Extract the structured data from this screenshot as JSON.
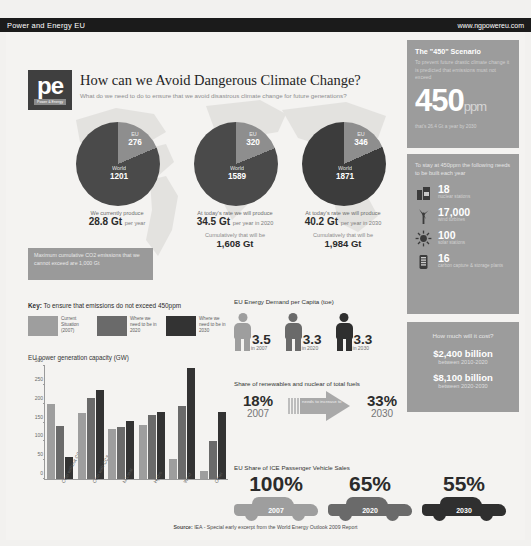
{
  "topbar": {
    "brand": "Power and Energy EU",
    "site": "www.ngpowereu.com"
  },
  "logo": {
    "mark": "pe",
    "sub": "Power & Energy"
  },
  "header": {
    "title": "How can we Avoid Dangerous Climate Change?",
    "subtitle": "What do we need to do to ensure that we avoid disastrous climate change for future generations?"
  },
  "chart_data": [
    {
      "type": "pie",
      "title": "Current emissions",
      "labels": [
        "EU",
        "World"
      ],
      "values": [
        276,
        1201
      ],
      "caption_before": "We currently produce",
      "caption_value": "28.8 Gt",
      "caption_after": "per year"
    },
    {
      "type": "pie",
      "title": "2020 emissions",
      "labels": [
        "EU",
        "World"
      ],
      "values": [
        320,
        1589
      ],
      "caption_before": "At today's rate we will produce",
      "caption_value": "34.5 Gt",
      "caption_after": "per year in 2020",
      "cumulative_label": "Cumulatively that will be",
      "cumulative_value": "1,608 Gt"
    },
    {
      "type": "pie",
      "title": "2030 emissions",
      "labels": [
        "EU",
        "World"
      ],
      "values": [
        346,
        1871
      ],
      "caption_before": "At today's rate we will produce",
      "caption_value": "40.2 Gt",
      "caption_after": "per year in 2030",
      "cumulative_label": "Cumulatively that will be",
      "cumulative_value": "1,984 Gt"
    },
    {
      "type": "bar",
      "title": "EU power generation capacity (GW)",
      "categories": [
        "Coal without CCS",
        "Coal with CCS",
        "Nuclear",
        "Hydro",
        "Wind",
        "Other"
      ],
      "series": [
        {
          "name": "Current Situation (2007)",
          "color": "#9e9e9e",
          "values": [
            200,
            175,
            133,
            144,
            52,
            22
          ]
        },
        {
          "name": "Where we need to be in 2020",
          "color": "#6a6a6a",
          "values": [
            140,
            214,
            138,
            170,
            195,
            102
          ]
        },
        {
          "name": "Where we need to be in 2030",
          "color": "#333333",
          "values": [
            58,
            235,
            153,
            178,
            296,
            178
          ]
        }
      ],
      "ylim": [
        0,
        300
      ],
      "yticks": [
        0,
        50,
        100,
        150,
        200,
        250,
        300
      ],
      "ylabel": "",
      "xlabel": "",
      "grid": false,
      "legend": "key"
    },
    {
      "type": "bar",
      "title": "EU Energy Demand per Capita (toe)",
      "categories": [
        "in 2007",
        "in 2020",
        "in 2030"
      ],
      "values": [
        3.5,
        3.3,
        3.3
      ],
      "ylabel": "toe per capita"
    },
    {
      "type": "bar",
      "title": "Share of renewables and nuclear of total fuels",
      "categories": [
        "2007",
        "2030"
      ],
      "values": [
        18,
        33
      ],
      "ylabel": "%",
      "annotation": "needs to increase to"
    },
    {
      "type": "bar",
      "title": "EU Share of ICE Passenger Vehicle Sales",
      "categories": [
        "2007",
        "2020",
        "2030"
      ],
      "values": [
        100,
        65,
        55
      ],
      "ylabel": "%"
    }
  ],
  "note_box": "Maximum cumulative CO2 emissions that we cannot exceed are 1,000 Gt",
  "key": {
    "label": "Key:",
    "text": "To ensure that emissions do not exceed 450ppm",
    "items": [
      {
        "label": "Current Situation (2007)",
        "color": "#9e9e9e"
      },
      {
        "label": "Where we need to be in 2020",
        "color": "#6a6a6a"
      },
      {
        "label": "Where we need to be in 2030",
        "color": "#333333"
      }
    ]
  },
  "sections": {
    "demand_title": "EU Energy Demand per Capita (toe)",
    "demand": [
      {
        "value": "3.5",
        "year": "in 2007",
        "color": "#9e9e9e"
      },
      {
        "value": "3.3",
        "year": "in 2020",
        "color": "#6a6a6a"
      },
      {
        "value": "3.3",
        "year": "in 2030",
        "color": "#2f2f2f"
      }
    ],
    "share_title": "Share of renewables and nuclear of total fuels",
    "share_from_pct": "18%",
    "share_from_year": "2007",
    "share_arrow_text": "needs to increase to",
    "share_to_pct": "33%",
    "share_to_year": "2030",
    "ice_title": "EU Share of ICE Passenger Vehicle Sales",
    "ice": [
      {
        "pct": "100%",
        "year": "2007",
        "color": "#9e9e9e"
      },
      {
        "pct": "65%",
        "year": "2020",
        "color": "#6a6a6a"
      },
      {
        "pct": "55%",
        "year": "2030",
        "color": "#2f2f2f"
      }
    ]
  },
  "source": {
    "label": "Source:",
    "text": " IEA - Special early excerpt from the World Energy Outlook 2009 Report"
  },
  "sidebar": {
    "scenario": {
      "title": "The \"450\" Scenario",
      "body": "To prevent future drastic climate change it is predicted that emissions must not exceed",
      "number": "450",
      "unit": "ppm",
      "foot": "that's 26.4 Gt a year by 2030"
    },
    "build": {
      "title": "To stay at 450ppm the following needs to be built each year",
      "rows": [
        {
          "icon": "nuclear-station-icon",
          "value": "18",
          "label": "nuclear stations"
        },
        {
          "icon": "wind-turbine-icon",
          "value": "17,000",
          "label": "wind turbines"
        },
        {
          "icon": "solar-station-icon",
          "value": "100",
          "label": "solar stations"
        },
        {
          "icon": "carbon-capture-icon",
          "value": "16",
          "label": "carbon capture & storage plants"
        }
      ]
    },
    "cost": {
      "title": "How much will it cost?",
      "items": [
        {
          "amount": "$2,400 billion",
          "period": "between 2010-2020"
        },
        {
          "amount": "$8,100 billion",
          "period": "between 2020-2030"
        }
      ]
    }
  },
  "colors": {
    "dark": "#3a3a3a",
    "mid": "#6a6a6a",
    "light": "#9e9e9e",
    "panel": "#9c9c9c",
    "paper": "#f4f3f1"
  }
}
